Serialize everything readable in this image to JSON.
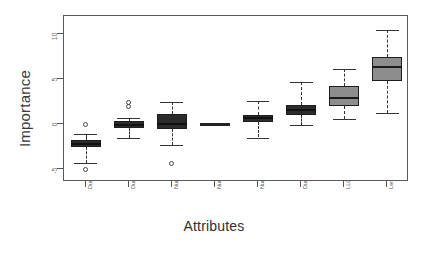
{
  "chart_data": {
    "type": "box",
    "title": "",
    "xlabel": "Attributes",
    "ylabel": "Importance",
    "ylim": [
      -6.5,
      11.5
    ],
    "yticks": [
      -5,
      0,
      5,
      10
    ],
    "ytick_labels": [
      "-5",
      "0",
      "5",
      "10"
    ],
    "grid": false,
    "legend": "none",
    "orientation": "vertical",
    "categories": [
      "Duration Min",
      "Duration Mean",
      "Number of committers",
      "Number of revisions",
      "Number of distinct commits",
      "Duration Max",
      "LLOC",
      "Length of source modifications"
    ],
    "boxes": [
      {
        "category": "Duration Min",
        "fill": "#2b2b2b",
        "whisker_low": -4.3,
        "q1": -2.6,
        "median": -2.25,
        "q3": -1.75,
        "whisker_high": -1.1,
        "outliers": [
          -0.1,
          -5.1
        ]
      },
      {
        "category": "Duration Mean",
        "fill": "#2b2b2b",
        "whisker_low": -1.6,
        "q1": -0.45,
        "median": -0.1,
        "q3": 0.35,
        "whisker_high": 0.65,
        "outliers": [
          2.0,
          2.4
        ]
      },
      {
        "category": "Number of committers",
        "fill": "#2b2b2b",
        "whisker_low": -2.3,
        "q1": -0.6,
        "median": 0.0,
        "q3": 1.1,
        "whisker_high": 2.5,
        "outliers": [
          -4.4
        ]
      },
      {
        "category": "Number of revisions",
        "fill": "#2b2b2b",
        "whisker_low": -0.05,
        "q1": -0.05,
        "median": 0.0,
        "q3": 0.05,
        "whisker_high": 0.05,
        "outliers": []
      },
      {
        "category": "Number of distinct commits",
        "fill": "#2b2b2b",
        "whisker_low": -1.5,
        "q1": 0.2,
        "median": 0.7,
        "q3": 1.05,
        "whisker_high": 2.6,
        "outliers": []
      },
      {
        "category": "Duration Max",
        "fill": "#2b2b2b",
        "whisker_low": -0.15,
        "q1": 1.05,
        "median": 1.6,
        "q3": 2.15,
        "whisker_high": 4.7,
        "outliers": []
      },
      {
        "category": "LLOC",
        "fill": "#8d8d8d",
        "whisker_low": 0.55,
        "q1": 1.95,
        "median": 2.85,
        "q3": 4.25,
        "whisker_high": 6.1,
        "outliers": []
      },
      {
        "category": "Length of source modifications",
        "fill": "#8d8d8d",
        "whisker_low": 1.2,
        "q1": 4.75,
        "median": 6.3,
        "q3": 7.4,
        "whisker_high": 10.5,
        "outliers": []
      }
    ]
  }
}
